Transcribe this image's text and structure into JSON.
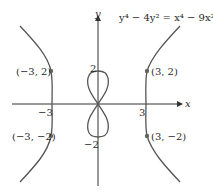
{
  "figure": {
    "equation": "y⁴ − 4y² = x⁴ − 9x²",
    "axes": {
      "x_label": "x",
      "y_label": "y",
      "x_ticks": [
        "−3",
        "3"
      ],
      "y_ticks": [
        "2",
        "−2"
      ]
    },
    "points": [
      {
        "label": "(−3, 2)",
        "x": -3,
        "y": 2
      },
      {
        "label": "(3, 2)",
        "x": 3,
        "y": 2
      },
      {
        "label": "(−3, −2)",
        "x": -3,
        "y": -2
      },
      {
        "label": "(3, −2)",
        "x": 3,
        "y": -2
      }
    ],
    "colors": {
      "curve": "#555555",
      "axis": "#333333",
      "point": "#666666"
    }
  }
}
